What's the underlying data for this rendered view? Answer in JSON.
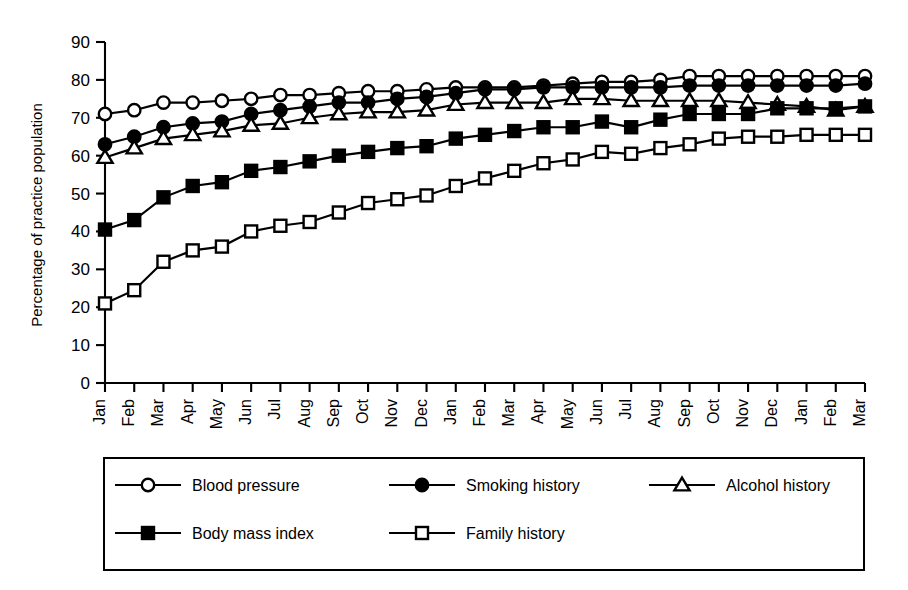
{
  "chart_data": {
    "type": "line",
    "title": "",
    "subtitle": "",
    "xlabel": "",
    "ylabel": "Percentage of practice population",
    "ylim": [
      0,
      90
    ],
    "yticks": [
      0,
      10,
      20,
      30,
      40,
      50,
      60,
      70,
      80,
      90
    ],
    "grid": false,
    "legend_position": "bottom",
    "categories": [
      "Jan",
      "Feb",
      "Mar",
      "Apr",
      "May",
      "Jun",
      "Jul",
      "Aug",
      "Sep",
      "Oct",
      "Nov",
      "Dec",
      "Jan",
      "Feb",
      "Mar",
      "Apr",
      "May",
      "Jun",
      "Jul",
      "Aug",
      "Sep",
      "Oct",
      "Nov",
      "Dec",
      "Jan",
      "Feb",
      "Mar"
    ],
    "series": [
      {
        "name": "Blood pressure",
        "marker": "open-circle",
        "values": [
          71,
          72,
          74,
          74,
          74.5,
          75,
          76,
          76,
          76.5,
          77,
          77,
          77.5,
          78,
          78,
          78,
          78.5,
          79,
          79.5,
          79.5,
          80,
          81,
          81,
          81,
          81,
          81,
          81,
          81
        ]
      },
      {
        "name": "Smoking history",
        "marker": "filled-circle",
        "values": [
          63,
          65,
          67.5,
          68.5,
          69,
          71,
          72,
          73,
          74,
          74,
          75,
          75.5,
          76.5,
          77.5,
          77.5,
          78,
          78,
          78,
          78,
          78,
          78.5,
          78.5,
          78.5,
          78.5,
          78.5,
          78.5,
          79
        ]
      },
      {
        "name": "Alcohol history",
        "marker": "open-triangle",
        "values": [
          59.5,
          62,
          64.5,
          65.5,
          66.5,
          68,
          68.5,
          70,
          71,
          71.5,
          71.5,
          72,
          73.5,
          74,
          74,
          74,
          75,
          75,
          74.5,
          74.5,
          74.5,
          74.5,
          74,
          73.5,
          73,
          72,
          73
        ]
      },
      {
        "name": "Body mass index",
        "marker": "filled-square",
        "values": [
          40.5,
          43,
          49,
          52,
          53,
          56,
          57,
          58.5,
          60,
          61,
          62,
          62.5,
          64.5,
          65.5,
          66.5,
          67.5,
          67.5,
          69,
          67.5,
          69.5,
          71,
          71,
          71,
          72.5,
          72.5,
          72.5,
          73
        ]
      },
      {
        "name": "Family history",
        "marker": "open-square",
        "values": [
          21,
          24.5,
          32,
          35,
          36,
          40,
          41.5,
          42.5,
          45,
          47.5,
          48.5,
          49.5,
          52,
          54,
          56,
          58,
          59,
          61,
          60.5,
          62,
          63,
          64.5,
          65,
          65,
          65.5,
          65.5,
          65.5
        ]
      }
    ]
  },
  "legend": {
    "entries": [
      {
        "label": "Blood pressure",
        "marker": "open-circle"
      },
      {
        "label": "Smoking history",
        "marker": "filled-circle"
      },
      {
        "label": "Alcohol history",
        "marker": "open-triangle"
      },
      {
        "label": "Body mass index",
        "marker": "filled-square"
      },
      {
        "label": "Family history",
        "marker": "open-square"
      }
    ]
  }
}
